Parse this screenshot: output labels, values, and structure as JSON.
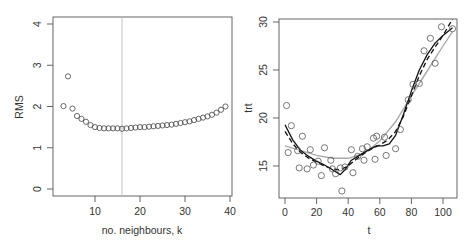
{
  "chart_data": [
    {
      "type": "scatter",
      "title": "",
      "xlabel": "no. neighbours, k",
      "ylabel": "RMS",
      "xlim": [
        1,
        41
      ],
      "ylim": [
        -0.1,
        4.2
      ],
      "xticks": [
        10,
        20,
        30,
        40
      ],
      "yticks": [
        0,
        1,
        2,
        3,
        4
      ],
      "grid": false,
      "vline": {
        "x": 16,
        "color": "#bbbbbb"
      },
      "series": [
        {
          "name": "RMS by k",
          "marker": "open-circle",
          "x": [
            3,
            4,
            5,
            6,
            7,
            8,
            9,
            10,
            11,
            12,
            13,
            14,
            15,
            16,
            17,
            18,
            19,
            20,
            21,
            22,
            23,
            24,
            25,
            26,
            27,
            28,
            29,
            30,
            31,
            32,
            33,
            34,
            35,
            36,
            37,
            38,
            39
          ],
          "y": [
            2.01,
            2.73,
            1.95,
            1.77,
            1.7,
            1.63,
            1.55,
            1.5,
            1.48,
            1.47,
            1.47,
            1.47,
            1.47,
            1.46,
            1.47,
            1.48,
            1.49,
            1.5,
            1.5,
            1.51,
            1.52,
            1.53,
            1.54,
            1.55,
            1.56,
            1.58,
            1.6,
            1.62,
            1.64,
            1.67,
            1.7,
            1.73,
            1.76,
            1.8,
            1.85,
            1.92,
            2.0
          ]
        }
      ]
    },
    {
      "type": "scatter",
      "title": "",
      "xlabel": "t",
      "ylabel": "trt",
      "xlim": [
        -4,
        110
      ],
      "ylim": [
        11.5,
        30.3
      ],
      "xticks": [
        0,
        20,
        40,
        60,
        80,
        100
      ],
      "yticks": [
        15,
        20,
        25,
        30
      ],
      "grid": false,
      "series": [
        {
          "name": "observations",
          "marker": "open-circle",
          "x": [
            1,
            2,
            4,
            8,
            9,
            11,
            14,
            16,
            18,
            21,
            23,
            25,
            29,
            30,
            32,
            35,
            36,
            38,
            42,
            43,
            46,
            49,
            50,
            52,
            56,
            57,
            58,
            63,
            64,
            70,
            73,
            78,
            81,
            85,
            88,
            92,
            95,
            99,
            106
          ],
          "y": [
            21.3,
            16.4,
            19.2,
            16.6,
            14.8,
            18.1,
            14.7,
            16.7,
            15.1,
            15.5,
            14.0,
            16.9,
            15.6,
            14.7,
            14.2,
            14.8,
            12.4,
            14.9,
            16.7,
            14.3,
            16.0,
            16.8,
            15.6,
            17.0,
            17.9,
            15.7,
            18.1,
            18.0,
            16.1,
            16.8,
            18.8,
            21.9,
            23.5,
            23.6,
            27.0,
            28.3,
            25.7,
            29.5,
            29.3
          ]
        },
        {
          "name": "smooth (solid black)",
          "line": "solid",
          "color": "#111111",
          "x": [
            0,
            5,
            10,
            15,
            20,
            25,
            30,
            35,
            38,
            42,
            47,
            52,
            58,
            62,
            66,
            70,
            75,
            80,
            85,
            90,
            95,
            100,
            106
          ],
          "y": [
            19.3,
            17.7,
            16.6,
            16.0,
            15.5,
            15.1,
            14.6,
            14.1,
            14.6,
            15.6,
            16.1,
            16.6,
            17.1,
            17.1,
            17.3,
            18.2,
            20.4,
            22.8,
            25.0,
            26.6,
            27.8,
            28.6,
            29.4
          ]
        },
        {
          "name": "smooth (dashed black)",
          "line": "dashed",
          "color": "#111111",
          "x": [
            0,
            5,
            10,
            15,
            20,
            25,
            30,
            35,
            40,
            45,
            50,
            55,
            60,
            65,
            70,
            75,
            80,
            85,
            90,
            95,
            100,
            106
          ],
          "y": [
            18.6,
            17.3,
            16.4,
            15.8,
            15.4,
            15.0,
            14.7,
            14.6,
            15.0,
            15.7,
            16.3,
            16.8,
            17.2,
            17.7,
            18.6,
            20.2,
            22.3,
            24.4,
            26.1,
            27.4,
            28.6,
            30.3
          ]
        },
        {
          "name": "smooth (solid grey)",
          "line": "solid",
          "color": "#aaaaaa",
          "x": [
            0,
            10,
            20,
            30,
            40,
            50,
            60,
            70,
            80,
            90,
            100,
            106
          ],
          "y": [
            17.1,
            16.6,
            16.1,
            15.8,
            15.8,
            16.3,
            17.6,
            19.6,
            22.3,
            24.9,
            27.5,
            29.0
          ]
        }
      ]
    }
  ],
  "left_plot": {
    "ylabel": "RMS",
    "xlabel": "no. neighbours, k",
    "yticks": [
      "0",
      "1",
      "2",
      "3",
      "4"
    ],
    "xticks": [
      "10",
      "20",
      "30",
      "40"
    ]
  },
  "right_plot": {
    "ylabel": "trt",
    "xlabel": "t",
    "yticks": [
      "15",
      "20",
      "25",
      "30"
    ],
    "xticks": [
      "0",
      "20",
      "40",
      "60",
      "80",
      "100"
    ]
  }
}
